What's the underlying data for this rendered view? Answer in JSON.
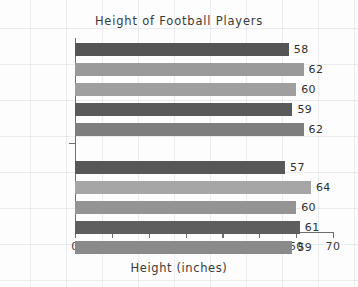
{
  "chart_data": {
    "type": "bar",
    "orientation": "horizontal",
    "title": "Height of Football Players",
    "xlabel": "Height (inches)",
    "ylabel": "",
    "xlim": [
      0,
      70
    ],
    "xticks": [
      0,
      10,
      20,
      30,
      40,
      50,
      60,
      70
    ],
    "xtick_labels": [
      "0",
      "10",
      "20",
      "30",
      "40",
      "50",
      "60",
      "70"
    ],
    "grid": false,
    "legend": "none",
    "categories": [
      "Ravens",
      "Falcons"
    ],
    "groups": [
      {
        "label": "Ravens",
        "values": [
          58,
          62,
          60,
          59,
          62
        ],
        "value_labels": [
          "58",
          "62",
          "60",
          "59",
          "62"
        ],
        "colors": [
          "#555555",
          "#9a9a9a",
          "#9f9f9f",
          "#5a5a5a",
          "#7e7e7e"
        ]
      },
      {
        "label": "Falcons",
        "values": [
          57,
          64,
          60,
          61,
          59
        ],
        "value_labels": [
          "57",
          "64",
          "60",
          "61",
          "59"
        ],
        "colors": [
          "#575757",
          "#a6a6a6",
          "#949494",
          "#5e5e5e",
          "#8a8a8a"
        ]
      }
    ],
    "all_values": [
      58,
      62,
      60,
      59,
      62,
      57,
      64,
      60,
      61,
      59
    ]
  }
}
